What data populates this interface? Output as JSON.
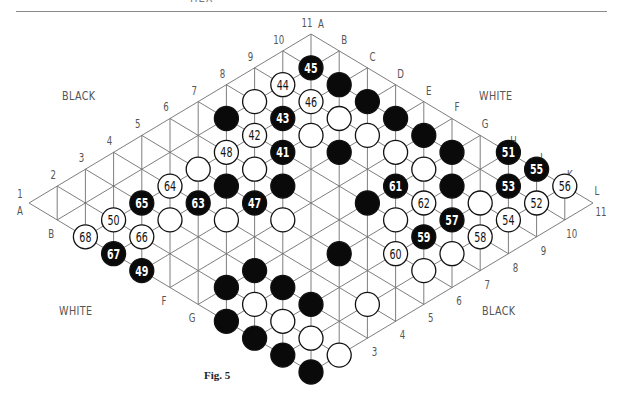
{
  "header": {
    "running_head": "HEX"
  },
  "caption": "Fig. 5",
  "side_labels": [
    {
      "id": "top-left",
      "text": "BLACK",
      "x": 62,
      "y": 89
    },
    {
      "id": "top-right",
      "text": "WHITE",
      "x": 479,
      "y": 89
    },
    {
      "id": "bottom-left",
      "text": "WHITE",
      "x": 59,
      "y": 304
    },
    {
      "id": "bottom-right",
      "text": "BLACK",
      "x": 482,
      "y": 304
    }
  ],
  "board": {
    "size": 11,
    "letters": [
      "A",
      "B",
      "C",
      "D",
      "E",
      "F",
      "G",
      "H",
      "J",
      "K",
      "L"
    ],
    "numbers": [
      "1",
      "2",
      "3",
      "4",
      "5",
      "6",
      "7",
      "8",
      "9",
      "10",
      "11"
    ],
    "origin": {
      "x": 29,
      "y": 203
    },
    "step": {
      "x": 28.2,
      "y": 16.9
    },
    "stone_radius": 12,
    "colors": {
      "line": "#6f6f6f",
      "black_stone": "#0a0a0a",
      "white_stone": "#ffffff",
      "label": "#555555"
    },
    "edge_labels": {
      "left_numbers": [
        "1",
        "2",
        "3",
        "4",
        "5",
        "6",
        "7",
        "8",
        "9",
        "10",
        "11"
      ],
      "top_letters": [
        "A",
        "B",
        "C",
        "D",
        "E",
        "F",
        "G",
        "H",
        "J",
        "K",
        "L"
      ],
      "bottom_left_letters": [
        "A",
        "B",
        "F",
        "G"
      ],
      "bottom_right_numbers": [
        "3",
        "4",
        "5",
        "6",
        "7",
        "8",
        "9",
        "10",
        "11"
      ]
    },
    "stones": [
      {
        "cell": "B10",
        "color": "black",
        "move": "45"
      },
      {
        "cell": "B9",
        "color": "white",
        "move": "44"
      },
      {
        "cell": "C9",
        "color": "white",
        "move": "46"
      },
      {
        "cell": "C10",
        "color": "black",
        "move": ""
      },
      {
        "cell": "D10",
        "color": "black",
        "move": ""
      },
      {
        "cell": "E10",
        "color": "black",
        "move": ""
      },
      {
        "cell": "F10",
        "color": "black",
        "move": ""
      },
      {
        "cell": "G10",
        "color": "black",
        "move": ""
      },
      {
        "cell": "H11",
        "color": "black",
        "move": "51"
      },
      {
        "cell": "J11",
        "color": "black",
        "move": "55"
      },
      {
        "cell": "K11",
        "color": "white",
        "move": "56"
      },
      {
        "cell": "K10",
        "color": "white",
        "move": "52"
      },
      {
        "cell": "J10",
        "color": "black",
        "move": "53"
      },
      {
        "cell": "K9",
        "color": "white",
        "move": "54"
      },
      {
        "cell": "J9",
        "color": "white",
        "move": ""
      },
      {
        "cell": "K8",
        "color": "white",
        "move": "58"
      },
      {
        "cell": "J8",
        "color": "black",
        "move": "57"
      },
      {
        "cell": "K7",
        "color": "white",
        "move": ""
      },
      {
        "cell": "J7",
        "color": "black",
        "move": "59"
      },
      {
        "cell": "K6",
        "color": "white",
        "move": ""
      },
      {
        "cell": "J6",
        "color": "white",
        "move": "60"
      },
      {
        "cell": "H7",
        "color": "white",
        "move": ""
      },
      {
        "cell": "H8",
        "color": "white",
        "move": "62"
      },
      {
        "cell": "G8",
        "color": "black",
        "move": "61"
      },
      {
        "cell": "H9",
        "color": "black",
        "move": ""
      },
      {
        "cell": "G9",
        "color": "white",
        "move": ""
      },
      {
        "cell": "F9",
        "color": "white",
        "move": ""
      },
      {
        "cell": "E9",
        "color": "white",
        "move": ""
      },
      {
        "cell": "D9",
        "color": "white",
        "move": ""
      },
      {
        "cell": "E8",
        "color": "black",
        "move": ""
      },
      {
        "cell": "D8",
        "color": "white",
        "move": ""
      },
      {
        "cell": "D7",
        "color": "black",
        "move": "41"
      },
      {
        "cell": "C8",
        "color": "black",
        "move": "43"
      },
      {
        "cell": "C7",
        "color": "white",
        "move": "42"
      },
      {
        "cell": "B8",
        "color": "white",
        "move": ""
      },
      {
        "cell": "B7",
        "color": "black",
        "move": ""
      },
      {
        "cell": "C6",
        "color": "white",
        "move": "48"
      },
      {
        "cell": "C5",
        "color": "white",
        "move": ""
      },
      {
        "cell": "D6",
        "color": "white",
        "move": ""
      },
      {
        "cell": "D5",
        "color": "black",
        "move": ""
      },
      {
        "cell": "E6",
        "color": "black",
        "move": ""
      },
      {
        "cell": "D4",
        "color": "black",
        "move": "63"
      },
      {
        "cell": "E5",
        "color": "black",
        "move": "47"
      },
      {
        "cell": "F5",
        "color": "white",
        "move": ""
      },
      {
        "cell": "E4",
        "color": "white",
        "move": ""
      },
      {
        "cell": "G7",
        "color": "black",
        "move": ""
      },
      {
        "cell": "C4",
        "color": "white",
        "move": "64"
      },
      {
        "cell": "C3",
        "color": "black",
        "move": "65"
      },
      {
        "cell": "D3",
        "color": "white",
        "move": ""
      },
      {
        "cell": "C2",
        "color": "white",
        "move": "50"
      },
      {
        "cell": "C1",
        "color": "white",
        "move": "68"
      },
      {
        "cell": "D2",
        "color": "white",
        "move": "66"
      },
      {
        "cell": "D1",
        "color": "black",
        "move": "67"
      },
      {
        "cell": "E1",
        "color": "black",
        "move": "49"
      },
      {
        "cell": "H5",
        "color": "black",
        "move": ""
      },
      {
        "cell": "G3",
        "color": "black",
        "move": ""
      },
      {
        "cell": "G2",
        "color": "black",
        "move": ""
      },
      {
        "cell": "H3",
        "color": "black",
        "move": ""
      },
      {
        "cell": "H2",
        "color": "white",
        "move": ""
      },
      {
        "cell": "H1",
        "color": "black",
        "move": ""
      },
      {
        "cell": "J3",
        "color": "black",
        "move": ""
      },
      {
        "cell": "J2",
        "color": "white",
        "move": ""
      },
      {
        "cell": "J1",
        "color": "black",
        "move": ""
      },
      {
        "cell": "K2",
        "color": "white",
        "move": ""
      },
      {
        "cell": "K1",
        "color": "black",
        "move": ""
      },
      {
        "cell": "L2",
        "color": "white",
        "move": ""
      },
      {
        "cell": "L1",
        "color": "black",
        "move": ""
      },
      {
        "cell": "K4",
        "color": "white",
        "move": ""
      }
    ]
  }
}
